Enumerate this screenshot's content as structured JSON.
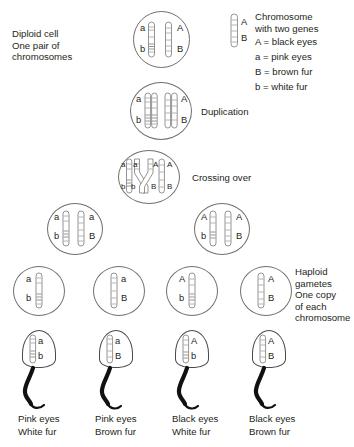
{
  "diagram": {
    "labels": {
      "diploid": "Diploid cell\nOne pair of\nchromosomes",
      "duplication": "Duplication",
      "crossing_over": "Crossing over",
      "haploid": "Haploid\ngametes\nOne copy\nof each\nchromosome"
    },
    "legend": {
      "heading": "Chromosome\nwith two genes",
      "entries": [
        "A = black eyes",
        "a = pink eyes",
        "B = brown fur",
        "b = white fur"
      ],
      "key_top": "A",
      "key_bottom": "B"
    },
    "stages": {
      "diploid_cell": {
        "left_chromosome": {
          "top": "a",
          "bottom": "b"
        },
        "right_chromosome": {
          "top": "A",
          "bottom": "B"
        }
      },
      "duplicated_cell": {
        "left_pair": {
          "top": "a",
          "bottom": "b"
        },
        "right_pair": {
          "top": "A",
          "bottom": "B"
        }
      },
      "crossing_over_cell": {
        "chromatid_1": {
          "top": "a",
          "bottom": "b"
        },
        "chromatid_2": {
          "top": "a",
          "bottom": "b"
        },
        "chromatid_3": {
          "top": "A",
          "bottom": "B"
        },
        "chromatid_4": {
          "top": "A",
          "bottom": "B"
        }
      },
      "meiosis_one_cells": [
        {
          "name": "left-daughter-cell",
          "left_chromatid": {
            "top": "a",
            "bottom": "b"
          },
          "right_chromatid": {
            "top": "a",
            "bottom": "B"
          }
        },
        {
          "name": "right-daughter-cell",
          "left_chromatid": {
            "top": "A",
            "bottom": "b"
          },
          "right_chromatid": {
            "top": "A",
            "bottom": "B"
          }
        }
      ],
      "gametes": [
        {
          "top": "a",
          "bottom": "b",
          "label_side": "left"
        },
        {
          "top": "a",
          "bottom": "B",
          "label_side": "right"
        },
        {
          "top": "A",
          "bottom": "b",
          "label_side": "left"
        },
        {
          "top": "A",
          "bottom": "B",
          "label_side": "right"
        }
      ],
      "sperm": [
        {
          "top": "a",
          "bottom": "b",
          "eyes": "Pink eyes",
          "fur": "White fur"
        },
        {
          "top": "a",
          "bottom": "B",
          "eyes": "Pink eyes",
          "fur": "Brown fur"
        },
        {
          "top": "A",
          "bottom": "b",
          "eyes": "Black eyes",
          "fur": "White fur"
        },
        {
          "top": "A",
          "bottom": "B",
          "eyes": "Black eyes",
          "fur": "Brown fur"
        }
      ]
    },
    "colors": {
      "ink": "#231f20",
      "outline": "#6f6f6f",
      "chromatid_stroke": "#7a7a7a",
      "tail": "#111111",
      "background": "#ffffff"
    }
  }
}
